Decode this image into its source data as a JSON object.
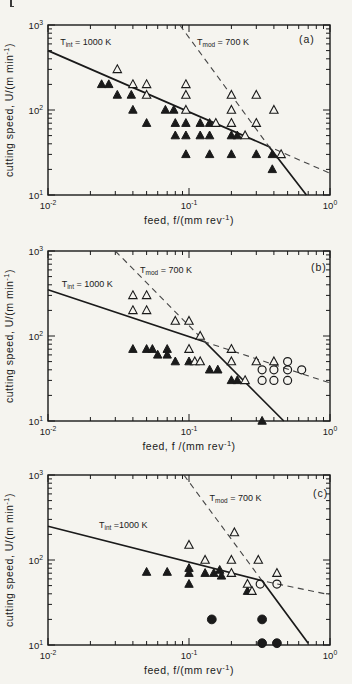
{
  "page": {
    "background": "#f5f4ef",
    "ink_color": "#1a1a1a",
    "dashed_line_color": "#454545",
    "corner_mark": "stray-page-mark"
  },
  "axes": {
    "xlabel": "feed,  f/(mm rev^{-1})",
    "ylabel": "cutting  speed,  U/(m min^{-1})",
    "x_tick_labels": [
      "10^{-2}",
      "10^{-1}",
      "10^{0}"
    ],
    "y_tick_labels": [
      "10^{1}",
      "10^{2}",
      "10^{3}"
    ],
    "xlim": [
      0.01,
      1.0
    ],
    "ylim": [
      10,
      1000
    ],
    "scale": "log-log",
    "grid": false
  },
  "chart_data": [
    {
      "type": "scatter",
      "panel_label": "(a)",
      "xlabel": "feed,  f/(mm rev^{-1})",
      "ylabel": "cutting  speed,  U/(m min^{-1})",
      "xlim": [
        0.01,
        1.0
      ],
      "ylim": [
        10,
        1000
      ],
      "series": [
        {
          "name": "filled-triangle",
          "marker": "triangle-filled",
          "points": [
            [
              0.024,
              200
            ],
            [
              0.027,
              200
            ],
            [
              0.031,
              150
            ],
            [
              0.039,
              150
            ],
            [
              0.04,
              100
            ],
            [
              0.05,
              70
            ],
            [
              0.068,
              100
            ],
            [
              0.078,
              100
            ],
            [
              0.08,
              70
            ],
            [
              0.08,
              50
            ],
            [
              0.095,
              70
            ],
            [
              0.095,
              50
            ],
            [
              0.095,
              30
            ],
            [
              0.12,
              70
            ],
            [
              0.12,
              50
            ],
            [
              0.14,
              70
            ],
            [
              0.14,
              50
            ],
            [
              0.14,
              30
            ],
            [
              0.2,
              50
            ],
            [
              0.22,
              50
            ],
            [
              0.2,
              30
            ],
            [
              0.3,
              30
            ],
            [
              0.39,
              30
            ],
            [
              0.39,
              20
            ]
          ]
        },
        {
          "name": "open-triangle",
          "marker": "triangle-open",
          "points": [
            [
              0.031,
              300
            ],
            [
              0.04,
              200
            ],
            [
              0.05,
              200
            ],
            [
              0.05,
              150
            ],
            [
              0.095,
              200
            ],
            [
              0.095,
              150
            ],
            [
              0.095,
              100
            ],
            [
              0.155,
              70
            ],
            [
              0.2,
              150
            ],
            [
              0.2,
              100
            ],
            [
              0.2,
              70
            ],
            [
              0.25,
              50
            ],
            [
              0.3,
              150
            ],
            [
              0.3,
              70
            ],
            [
              0.4,
              100
            ],
            [
              0.45,
              30
            ]
          ]
        }
      ],
      "lines": [
        {
          "name": "tint-line",
          "style": "solid",
          "label": "T_{int} = 1000 K",
          "label_pos": [
            0.0122,
            580
          ],
          "points": [
            [
              0.01,
              500
            ],
            [
              0.37,
              37
            ],
            [
              0.68,
              10
            ]
          ]
        },
        {
          "name": "tmod-line",
          "style": "dashed",
          "label": "T_{mod} = 700 K",
          "label_pos": [
            0.114,
            580
          ],
          "points": [
            [
              0.086,
              1000
            ],
            [
              0.37,
              37
            ],
            [
              1.0,
              18
            ]
          ]
        }
      ],
      "layout": {
        "top_px": 25,
        "letter_px": [
          299,
          43
        ]
      }
    },
    {
      "type": "scatter",
      "panel_label": "(b)",
      "xlabel": "feed,  f /(mm rev^{-1})",
      "ylabel": "cutting  speed,  U/(m min^{-1})",
      "xlim": [
        0.01,
        1.0
      ],
      "ylim": [
        10,
        1000
      ],
      "series": [
        {
          "name": "filled-triangle",
          "marker": "triangle-filled",
          "points": [
            [
              0.04,
              70
            ],
            [
              0.05,
              70
            ],
            [
              0.055,
              70
            ],
            [
              0.06,
              60
            ],
            [
              0.07,
              70
            ],
            [
              0.07,
              60
            ],
            [
              0.08,
              50
            ],
            [
              0.1,
              50
            ],
            [
              0.14,
              40
            ],
            [
              0.16,
              40
            ],
            [
              0.2,
              30
            ],
            [
              0.22,
              30
            ],
            [
              0.33,
              10
            ]
          ]
        },
        {
          "name": "open-triangle",
          "marker": "triangle-open",
          "points": [
            [
              0.04,
              300
            ],
            [
              0.05,
              300
            ],
            [
              0.04,
              200
            ],
            [
              0.05,
              200
            ],
            [
              0.08,
              150
            ],
            [
              0.1,
              150
            ],
            [
              0.12,
              100
            ],
            [
              0.1,
              70
            ],
            [
              0.11,
              50
            ],
            [
              0.12,
              50
            ],
            [
              0.2,
              70
            ],
            [
              0.2,
              50
            ],
            [
              0.25,
              30
            ],
            [
              0.3,
              50
            ],
            [
              0.4,
              50
            ]
          ]
        },
        {
          "name": "open-circle",
          "marker": "circle-open",
          "points": [
            [
              0.5,
              50
            ],
            [
              0.33,
              40
            ],
            [
              0.4,
              40
            ],
            [
              0.5,
              40
            ],
            [
              0.63,
              40
            ],
            [
              0.33,
              30
            ],
            [
              0.4,
              30
            ],
            [
              0.5,
              30
            ]
          ]
        }
      ],
      "lines": [
        {
          "name": "tint-line",
          "style": "solid",
          "label": "T_{int} = 1000 K",
          "label_pos": [
            0.0125,
            380
          ],
          "points": [
            [
              0.01,
              350
            ],
            [
              0.13,
              85
            ],
            [
              0.47,
              10
            ]
          ]
        },
        {
          "name": "tmod-line",
          "style": "dashed",
          "label": "T_{mod} = 700 K",
          "label_pos": [
            0.045,
            545
          ],
          "points": [
            [
              0.03,
              1000
            ],
            [
              0.13,
              85
            ],
            [
              1.0,
              28
            ]
          ]
        }
      ],
      "layout": {
        "top_px": 23,
        "letter_px": [
          311,
          43
        ]
      }
    },
    {
      "type": "scatter",
      "panel_label": "(c)",
      "xlabel": "feed,   f/(mm rev^{-1})",
      "ylabel": "cutting  speed,  U/(m min^{-1})",
      "xlim": [
        0.01,
        1.0
      ],
      "ylim": [
        10,
        1000
      ],
      "series": [
        {
          "name": "filled-triangle",
          "marker": "triangle-filled",
          "points": [
            [
              0.05,
              72
            ],
            [
              0.07,
              72
            ],
            [
              0.1,
              80
            ],
            [
              0.1,
              70
            ],
            [
              0.1,
              52
            ],
            [
              0.13,
              70
            ],
            [
              0.15,
              70
            ],
            [
              0.165,
              76
            ],
            [
              0.17,
              65
            ],
            [
              0.26,
              43
            ]
          ]
        },
        {
          "name": "open-triangle",
          "marker": "triangle-open",
          "points": [
            [
              0.1,
              150
            ],
            [
              0.13,
              100
            ],
            [
              0.21,
              210
            ],
            [
              0.2,
              100
            ],
            [
              0.2,
              70
            ],
            [
              0.26,
              52
            ],
            [
              0.28,
              43
            ],
            [
              0.31,
              100
            ],
            [
              0.42,
              70
            ]
          ]
        },
        {
          "name": "filled-circle",
          "marker": "circle-filled",
          "points": [
            [
              0.145,
              20
            ],
            [
              0.33,
              20
            ],
            [
              0.33,
              10.5
            ],
            [
              0.42,
              10.5
            ]
          ]
        },
        {
          "name": "open-circle",
          "marker": "circle-open",
          "points": [
            [
              0.32,
              52
            ],
            [
              0.42,
              52
            ]
          ]
        }
      ],
      "lines": [
        {
          "name": "tint-line",
          "style": "solid",
          "label": "T_{int} =1000 K",
          "label_pos": [
            0.023,
            235
          ],
          "points": [
            [
              0.01,
              250
            ],
            [
              0.33,
              57
            ],
            [
              0.7,
              10.5
            ]
          ]
        },
        {
          "name": "tmod-line",
          "style": "dashed",
          "label": "T_{mod} = 700 K",
          "label_pos": [
            0.14,
            495
          ],
          "points": [
            [
              0.092,
              1000
            ],
            [
              0.33,
              57
            ],
            [
              1.0,
              39
            ]
          ]
        }
      ],
      "layout": {
        "top_px": 19,
        "letter_px": [
          313,
          41
        ]
      }
    }
  ]
}
